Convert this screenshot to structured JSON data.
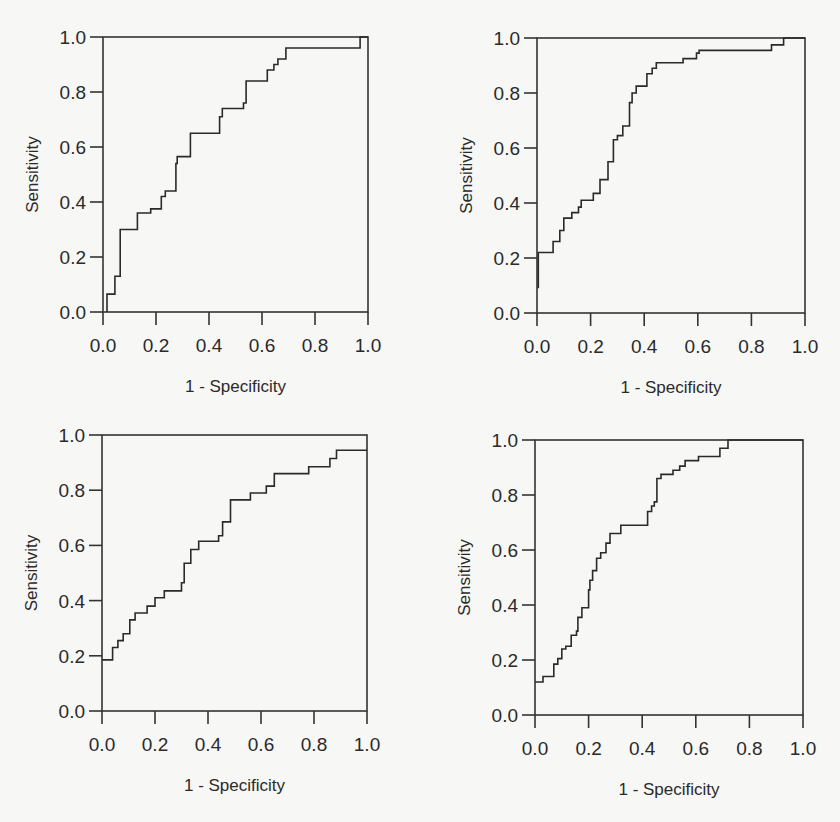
{
  "figure": {
    "panel_count": 4,
    "line_color": "#2a2a2a",
    "background": "#f7f7f5"
  },
  "chart_data": [
    {
      "type": "line",
      "subtype": "roc-step",
      "panel": "top-left",
      "title": "",
      "xlabel": "1 - Specificity",
      "ylabel": "Sensitivity",
      "xlim": [
        0,
        1
      ],
      "ylim": [
        0,
        1
      ],
      "xticks": [
        "0.0",
        "0.2",
        "0.4",
        "0.6",
        "0.8",
        "1.0"
      ],
      "yticks": [
        "0.0",
        "0.2",
        "0.4",
        "0.6",
        "0.8",
        "1.0"
      ],
      "grid": false,
      "legend": null,
      "steps": [
        [
          0.015,
          0.0
        ],
        [
          0.015,
          0.065
        ],
        [
          0.045,
          0.065
        ],
        [
          0.045,
          0.13
        ],
        [
          0.065,
          0.13
        ],
        [
          0.065,
          0.3
        ],
        [
          0.13,
          0.3
        ],
        [
          0.13,
          0.36
        ],
        [
          0.18,
          0.36
        ],
        [
          0.18,
          0.375
        ],
        [
          0.22,
          0.375
        ],
        [
          0.22,
          0.42
        ],
        [
          0.235,
          0.42
        ],
        [
          0.235,
          0.44
        ],
        [
          0.275,
          0.44
        ],
        [
          0.275,
          0.54
        ],
        [
          0.28,
          0.54
        ],
        [
          0.28,
          0.565
        ],
        [
          0.33,
          0.565
        ],
        [
          0.33,
          0.65
        ],
        [
          0.44,
          0.65
        ],
        [
          0.44,
          0.71
        ],
        [
          0.45,
          0.71
        ],
        [
          0.45,
          0.74
        ],
        [
          0.53,
          0.74
        ],
        [
          0.53,
          0.76
        ],
        [
          0.54,
          0.76
        ],
        [
          0.54,
          0.84
        ],
        [
          0.62,
          0.84
        ],
        [
          0.62,
          0.88
        ],
        [
          0.645,
          0.88
        ],
        [
          0.645,
          0.9
        ],
        [
          0.66,
          0.9
        ],
        [
          0.66,
          0.92
        ],
        [
          0.69,
          0.92
        ],
        [
          0.69,
          0.96
        ],
        [
          0.97,
          0.96
        ],
        [
          0.97,
          1.0
        ],
        [
          1.0,
          1.0
        ]
      ]
    },
    {
      "type": "line",
      "subtype": "roc-step",
      "panel": "top-right",
      "title": "",
      "xlabel": "1 - Specificity",
      "ylabel": "Sensitivity",
      "xlim": [
        0,
        1
      ],
      "ylim": [
        0,
        1
      ],
      "xticks": [
        "0.0",
        "0.2",
        "0.4",
        "0.6",
        "0.8",
        "1.0"
      ],
      "yticks": [
        "0.0",
        "0.2",
        "0.4",
        "0.6",
        "0.8",
        "1.0"
      ],
      "grid": false,
      "legend": null,
      "steps": [
        [
          0.005,
          0.09
        ],
        [
          0.005,
          0.22
        ],
        [
          0.06,
          0.22
        ],
        [
          0.06,
          0.26
        ],
        [
          0.085,
          0.26
        ],
        [
          0.085,
          0.3
        ],
        [
          0.1,
          0.3
        ],
        [
          0.1,
          0.345
        ],
        [
          0.13,
          0.345
        ],
        [
          0.13,
          0.365
        ],
        [
          0.155,
          0.365
        ],
        [
          0.155,
          0.385
        ],
        [
          0.165,
          0.385
        ],
        [
          0.165,
          0.41
        ],
        [
          0.21,
          0.41
        ],
        [
          0.21,
          0.435
        ],
        [
          0.235,
          0.435
        ],
        [
          0.235,
          0.485
        ],
        [
          0.265,
          0.485
        ],
        [
          0.265,
          0.55
        ],
        [
          0.285,
          0.55
        ],
        [
          0.285,
          0.63
        ],
        [
          0.3,
          0.63
        ],
        [
          0.3,
          0.645
        ],
        [
          0.32,
          0.645
        ],
        [
          0.32,
          0.68
        ],
        [
          0.345,
          0.68
        ],
        [
          0.345,
          0.765
        ],
        [
          0.355,
          0.765
        ],
        [
          0.355,
          0.8
        ],
        [
          0.37,
          0.8
        ],
        [
          0.37,
          0.825
        ],
        [
          0.41,
          0.825
        ],
        [
          0.41,
          0.87
        ],
        [
          0.43,
          0.87
        ],
        [
          0.43,
          0.89
        ],
        [
          0.445,
          0.89
        ],
        [
          0.445,
          0.91
        ],
        [
          0.545,
          0.91
        ],
        [
          0.545,
          0.925
        ],
        [
          0.595,
          0.925
        ],
        [
          0.595,
          0.945
        ],
        [
          0.605,
          0.945
        ],
        [
          0.605,
          0.955
        ],
        [
          0.875,
          0.955
        ],
        [
          0.875,
          0.975
        ],
        [
          0.92,
          0.975
        ],
        [
          0.92,
          1.0
        ],
        [
          1.0,
          1.0
        ]
      ]
    },
    {
      "type": "line",
      "subtype": "roc-step",
      "panel": "bottom-left",
      "title": "",
      "xlabel": "1 - Specificity",
      "ylabel": "Sensitivity",
      "xlim": [
        0,
        1
      ],
      "ylim": [
        0,
        1
      ],
      "xticks": [
        "0.0",
        "0.2",
        "0.4",
        "0.6",
        "0.8",
        "1.0"
      ],
      "yticks": [
        "0.0",
        "0.2",
        "0.4",
        "0.6",
        "0.8",
        "1.0"
      ],
      "grid": false,
      "legend": null,
      "steps": [
        [
          0.0,
          0.185
        ],
        [
          0.04,
          0.185
        ],
        [
          0.04,
          0.23
        ],
        [
          0.06,
          0.23
        ],
        [
          0.06,
          0.255
        ],
        [
          0.08,
          0.255
        ],
        [
          0.08,
          0.28
        ],
        [
          0.105,
          0.28
        ],
        [
          0.105,
          0.33
        ],
        [
          0.125,
          0.33
        ],
        [
          0.125,
          0.355
        ],
        [
          0.17,
          0.355
        ],
        [
          0.17,
          0.38
        ],
        [
          0.2,
          0.38
        ],
        [
          0.2,
          0.41
        ],
        [
          0.235,
          0.41
        ],
        [
          0.235,
          0.435
        ],
        [
          0.3,
          0.435
        ],
        [
          0.3,
          0.465
        ],
        [
          0.31,
          0.465
        ],
        [
          0.31,
          0.535
        ],
        [
          0.335,
          0.535
        ],
        [
          0.335,
          0.585
        ],
        [
          0.365,
          0.585
        ],
        [
          0.365,
          0.615
        ],
        [
          0.44,
          0.615
        ],
        [
          0.44,
          0.635
        ],
        [
          0.455,
          0.635
        ],
        [
          0.455,
          0.685
        ],
        [
          0.485,
          0.685
        ],
        [
          0.485,
          0.765
        ],
        [
          0.56,
          0.765
        ],
        [
          0.56,
          0.79
        ],
        [
          0.62,
          0.79
        ],
        [
          0.62,
          0.815
        ],
        [
          0.65,
          0.815
        ],
        [
          0.65,
          0.86
        ],
        [
          0.78,
          0.86
        ],
        [
          0.78,
          0.885
        ],
        [
          0.86,
          0.885
        ],
        [
          0.86,
          0.915
        ],
        [
          0.885,
          0.915
        ],
        [
          0.885,
          0.945
        ],
        [
          1.0,
          0.945
        ]
      ]
    },
    {
      "type": "line",
      "subtype": "roc-step",
      "panel": "bottom-right",
      "title": "",
      "xlabel": "1 - Specificity",
      "ylabel": "Sensitivity",
      "xlim": [
        0,
        1
      ],
      "ylim": [
        0,
        1
      ],
      "xticks": [
        "0.0",
        "0.2",
        "0.4",
        "0.6",
        "0.8",
        "1.0"
      ],
      "yticks": [
        "0.0",
        "0.2",
        "0.4",
        "0.6",
        "0.8",
        "1.0"
      ],
      "grid": false,
      "legend": null,
      "steps": [
        [
          0.0,
          0.12
        ],
        [
          0.03,
          0.12
        ],
        [
          0.03,
          0.14
        ],
        [
          0.07,
          0.14
        ],
        [
          0.07,
          0.185
        ],
        [
          0.085,
          0.185
        ],
        [
          0.085,
          0.205
        ],
        [
          0.1,
          0.205
        ],
        [
          0.1,
          0.24
        ],
        [
          0.115,
          0.24
        ],
        [
          0.115,
          0.25
        ],
        [
          0.135,
          0.25
        ],
        [
          0.135,
          0.29
        ],
        [
          0.155,
          0.29
        ],
        [
          0.155,
          0.305
        ],
        [
          0.16,
          0.305
        ],
        [
          0.16,
          0.355
        ],
        [
          0.175,
          0.355
        ],
        [
          0.175,
          0.39
        ],
        [
          0.2,
          0.39
        ],
        [
          0.2,
          0.455
        ],
        [
          0.205,
          0.455
        ],
        [
          0.205,
          0.49
        ],
        [
          0.215,
          0.49
        ],
        [
          0.215,
          0.525
        ],
        [
          0.23,
          0.525
        ],
        [
          0.23,
          0.57
        ],
        [
          0.245,
          0.57
        ],
        [
          0.245,
          0.59
        ],
        [
          0.265,
          0.59
        ],
        [
          0.265,
          0.625
        ],
        [
          0.28,
          0.625
        ],
        [
          0.28,
          0.66
        ],
        [
          0.32,
          0.66
        ],
        [
          0.32,
          0.69
        ],
        [
          0.42,
          0.69
        ],
        [
          0.42,
          0.74
        ],
        [
          0.435,
          0.74
        ],
        [
          0.435,
          0.76
        ],
        [
          0.445,
          0.76
        ],
        [
          0.445,
          0.775
        ],
        [
          0.455,
          0.775
        ],
        [
          0.455,
          0.86
        ],
        [
          0.47,
          0.86
        ],
        [
          0.47,
          0.875
        ],
        [
          0.515,
          0.875
        ],
        [
          0.515,
          0.89
        ],
        [
          0.54,
          0.89
        ],
        [
          0.54,
          0.905
        ],
        [
          0.56,
          0.905
        ],
        [
          0.56,
          0.925
        ],
        [
          0.61,
          0.925
        ],
        [
          0.61,
          0.94
        ],
        [
          0.69,
          0.94
        ],
        [
          0.69,
          0.97
        ],
        [
          0.72,
          0.97
        ],
        [
          0.72,
          1.0
        ],
        [
          1.0,
          1.0
        ]
      ]
    }
  ],
  "layout": {
    "panels": [
      {
        "left": 103,
        "top": 37,
        "right": 368,
        "bottom": 312
      },
      {
        "left": 537,
        "top": 38,
        "right": 805,
        "bottom": 313
      },
      {
        "left": 102,
        "top": 435,
        "right": 367,
        "bottom": 711
      },
      {
        "left": 535,
        "top": 440,
        "right": 803,
        "bottom": 715
      }
    ]
  }
}
